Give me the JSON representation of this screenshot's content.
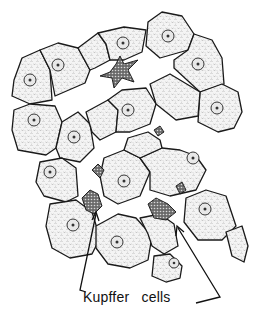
{
  "figure": {
    "label": "Kupffer   cells",
    "label_words": [
      "Kupffer",
      "cells"
    ],
    "arrow_count": 2,
    "colors": {
      "ink": "#1a1a1a",
      "background": "#ffffff",
      "cell_fill": "#f0f0f0"
    }
  }
}
